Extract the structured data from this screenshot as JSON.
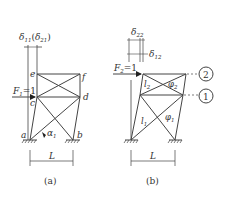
{
  "figure": {
    "panel_a": {
      "caption": "(a)",
      "nodes": {
        "a": "a",
        "b": "b",
        "c": "c",
        "d": "d",
        "e": "e",
        "f": "f"
      },
      "force_label": "F",
      "force_sub": "1",
      "force_eq": "=1",
      "angle_label": "α",
      "angle_sub": "1",
      "delta_label_main": "δ",
      "delta_sub_main": "11",
      "delta_label_alt": "δ",
      "delta_sub_alt": "21",
      "span_label": "L"
    },
    "panel_b": {
      "caption": "(b)",
      "force_label": "F",
      "force_sub": "2",
      "force_eq": "=1",
      "delta_top": "δ",
      "delta_top_sub": "22",
      "delta_side": "δ",
      "delta_side_sub": "12",
      "l2_label": "l",
      "l2_sub": "2",
      "phi2_label": "φ",
      "phi2_sub": "2",
      "l1_label": "l",
      "l1_sub": "1",
      "phi1_label": "φ",
      "phi1_sub": "1",
      "level_2": "2",
      "level_1": "1",
      "span_label": "L"
    }
  }
}
